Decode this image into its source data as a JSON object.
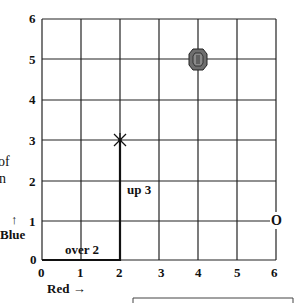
{
  "grid": {
    "x_ticks": [
      "0",
      "1",
      "2",
      "3",
      "4",
      "5",
      "6"
    ],
    "y_ticks": [
      "0",
      "1",
      "2",
      "3",
      "4",
      "5",
      "6"
    ],
    "x_axis_label": "Red →",
    "y_axis_label": "Blue",
    "y_axis_arrow": "↑"
  },
  "annotations": {
    "over": "over 2",
    "up": "up 3"
  },
  "markers": [
    {
      "name": "star-marker",
      "symbol": "✶",
      "x": 2,
      "y": 3
    },
    {
      "name": "gem-marker",
      "symbol": "gem",
      "x": 4,
      "y": 5
    },
    {
      "name": "origin-marker",
      "symbol": "O",
      "x": 6,
      "y": 1
    }
  ],
  "side_text": {
    "line1": "of",
    "line2": "n"
  },
  "colors": {
    "grid": "#222222",
    "gem_fill": "#6e6e6e",
    "background": "#ffffff"
  }
}
